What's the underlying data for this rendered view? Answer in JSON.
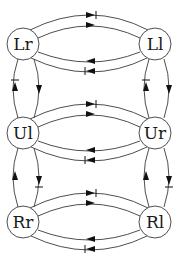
{
  "diagram": {
    "type": "state-transition graph",
    "nodes": [
      {
        "id": "Lr",
        "label": "Lr",
        "x": 23,
        "y": 44
      },
      {
        "id": "Ll",
        "label": "Ll",
        "x": 155,
        "y": 44
      },
      {
        "id": "Ul",
        "label": "Ul",
        "x": 23,
        "y": 133
      },
      {
        "id": "Ur",
        "label": "Ur",
        "x": 155,
        "y": 133
      },
      {
        "id": "Rr",
        "label": "Rr",
        "x": 23,
        "y": 222
      },
      {
        "id": "Rl",
        "label": "Rl",
        "x": 155,
        "y": 222
      }
    ],
    "edges": [
      {
        "from": "Lr",
        "to": "Ll",
        "style": "arrow-with-bar"
      },
      {
        "from": "Lr",
        "to": "Ll",
        "style": "arrow"
      },
      {
        "from": "Ll",
        "to": "Lr",
        "style": "arrow"
      },
      {
        "from": "Ll",
        "to": "Lr",
        "style": "arrow-with-bar"
      },
      {
        "from": "Ul",
        "to": "Ur",
        "style": "arrow-with-bar"
      },
      {
        "from": "Ul",
        "to": "Ur",
        "style": "arrow"
      },
      {
        "from": "Ur",
        "to": "Ul",
        "style": "arrow"
      },
      {
        "from": "Ur",
        "to": "Ul",
        "style": "arrow-with-bar"
      },
      {
        "from": "Rr",
        "to": "Rl",
        "style": "arrow-with-bar"
      },
      {
        "from": "Rr",
        "to": "Rl",
        "style": "arrow"
      },
      {
        "from": "Rl",
        "to": "Rr",
        "style": "arrow"
      },
      {
        "from": "Rl",
        "to": "Rr",
        "style": "arrow-with-bar"
      },
      {
        "from": "Ul",
        "to": "Lr",
        "style": "arrow-with-bar"
      },
      {
        "from": "Lr",
        "to": "Ul",
        "style": "arrow"
      },
      {
        "from": "Rr",
        "to": "Ul",
        "style": "arrow"
      },
      {
        "from": "Ul",
        "to": "Rr",
        "style": "arrow-with-bar"
      },
      {
        "from": "Ur",
        "to": "Ll",
        "style": "arrow-with-bar"
      },
      {
        "from": "Ll",
        "to": "Ur",
        "style": "arrow"
      },
      {
        "from": "Rl",
        "to": "Ur",
        "style": "arrow"
      },
      {
        "from": "Ur",
        "to": "Rl",
        "style": "arrow-with-bar"
      }
    ]
  }
}
